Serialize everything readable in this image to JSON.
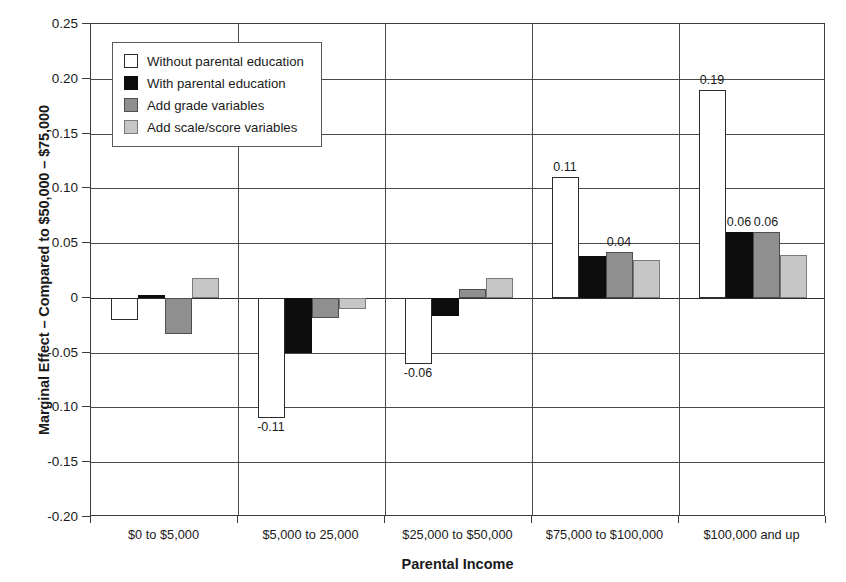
{
  "chart_data": {
    "type": "bar",
    "title": "",
    "xlabel": "Parental Income",
    "ylabel": "Marginal Effect – Compared to $50,000 – $75,000",
    "ylim": [
      -0.2,
      0.25
    ],
    "ytick_labels": [
      "0.25",
      "0.20",
      "0.15",
      "0.10",
      "0.05",
      "0",
      "-0.05",
      "-0.10",
      "-0.15",
      "-0.20"
    ],
    "ytick_values": [
      0.25,
      0.2,
      0.15,
      0.1,
      0.05,
      0,
      -0.05,
      -0.1,
      -0.15,
      -0.2
    ],
    "grid": true,
    "legend_position": "upper-left-inside",
    "categories": [
      "$0 to $5,000",
      "$5,000 to 25,000",
      "$25,000 to $50,000",
      "$75,000 to $100,000",
      "$100,000 and up"
    ],
    "series": [
      {
        "name": "Without parental education",
        "color": "#ffffff",
        "edge": "#2b2b2b",
        "values": [
          -0.02,
          -0.11,
          -0.06,
          0.11,
          0.19
        ],
        "labels": [
          "",
          "-0.11",
          "-0.06",
          "0.11",
          "0.19"
        ]
      },
      {
        "name": "With parental education",
        "color": "#0d0d0d",
        "edge": "#0d0d0d",
        "values": [
          0.003,
          -0.05,
          -0.017,
          0.038,
          0.06
        ],
        "labels": [
          "",
          "",
          "",
          "",
          "0.06"
        ]
      },
      {
        "name": "Add grade variables",
        "color": "#8f8f8f",
        "edge": "#4d4d4d",
        "values": [
          -0.033,
          -0.018,
          0.008,
          0.042,
          0.06
        ],
        "labels": [
          "",
          "",
          "",
          "0.04",
          "0.06"
        ]
      },
      {
        "name": "Add scale/score variables",
        "color": "#c6c6c6",
        "edge": "#7a7a7a",
        "values": [
          0.018,
          -0.01,
          0.018,
          0.035,
          0.039
        ],
        "labels": [
          "",
          "",
          "",
          "",
          ""
        ]
      }
    ]
  }
}
